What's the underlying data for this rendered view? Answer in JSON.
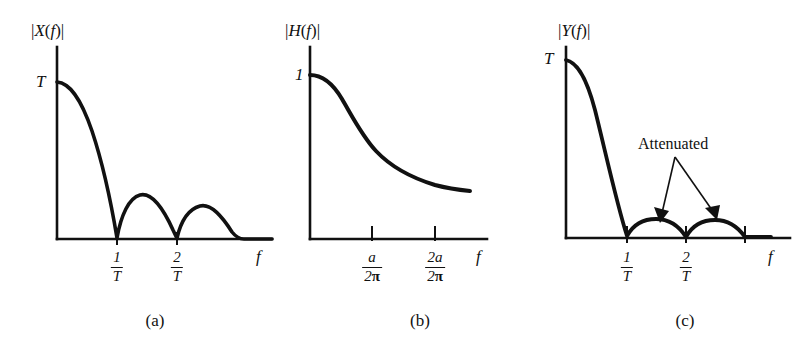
{
  "figure": {
    "background": "#ffffff",
    "ink": "#111111"
  },
  "panels": [
    {
      "id": "a",
      "caption": "(a)",
      "y_axis_label": "|X(f)|",
      "y_value_label": "T",
      "x_axis_label": "f",
      "tick_labels": [
        {
          "num": "1",
          "den": "T"
        },
        {
          "num": "2",
          "den": "T"
        }
      ],
      "annotations": []
    },
    {
      "id": "b",
      "caption": "(b)",
      "y_axis_label": "|H(f)|",
      "y_value_label": "1",
      "x_axis_label": "f",
      "tick_labels": [
        {
          "num": "a",
          "den": "2π"
        },
        {
          "num": "2a",
          "den": "2π"
        }
      ],
      "annotations": []
    },
    {
      "id": "c",
      "caption": "(c)",
      "y_axis_label": "|Y(f)|",
      "y_value_label": "T",
      "x_axis_label": "f",
      "tick_labels": [
        {
          "num": "1",
          "den": "T"
        },
        {
          "num": "2",
          "den": "T"
        }
      ],
      "annotations": [
        "Attenuated"
      ]
    }
  ],
  "chart_data": [
    {
      "type": "line",
      "title": "|X(f)|",
      "xlabel": "f",
      "ylabel": "|X(f)|",
      "curve": "rectified sinc magnitude spectrum |T sinc(fT)|",
      "x_tick_values": [
        1,
        2
      ],
      "x_tick_text": [
        "1/T",
        "2/T"
      ],
      "y_tick_values": [
        1
      ],
      "y_tick_text": [
        "T"
      ],
      "xlim": [
        0,
        3.6
      ],
      "ylim": [
        0,
        1.12
      ],
      "grid": false,
      "legend": "none",
      "x": [
        0.0,
        0.1,
        0.2,
        0.3,
        0.4,
        0.5,
        0.6,
        0.7,
        0.8,
        0.9,
        1.0,
        1.1,
        1.2,
        1.3,
        1.4,
        1.5,
        1.6,
        1.7,
        1.8,
        1.9,
        2.0,
        2.1,
        2.2,
        2.3,
        2.4,
        2.5,
        2.6,
        2.7,
        2.8,
        2.9,
        3.0,
        3.1,
        3.2,
        3.3,
        3.4,
        3.5
      ],
      "y": [
        1.0,
        0.984,
        0.935,
        0.858,
        0.757,
        0.637,
        0.505,
        0.368,
        0.234,
        0.109,
        0.0,
        0.089,
        0.156,
        0.198,
        0.216,
        0.212,
        0.189,
        0.151,
        0.104,
        0.052,
        0.0,
        0.047,
        0.086,
        0.114,
        0.129,
        0.127,
        0.113,
        0.091,
        0.063,
        0.032,
        0.0,
        0.031,
        0.057,
        0.076,
        0.087,
        0.089
      ]
    },
    {
      "type": "line",
      "title": "|H(f)|",
      "xlabel": "f",
      "ylabel": "|H(f)|",
      "curve": "first-order lowpass magnitude response 1/sqrt(1+(2πf/a)^2)",
      "x_tick_values": [
        1,
        2
      ],
      "x_tick_text": [
        "a/2π",
        "2a/2π"
      ],
      "y_tick_values": [
        1
      ],
      "y_tick_text": [
        "1"
      ],
      "xlim": [
        0,
        2.9
      ],
      "ylim": [
        0,
        1.12
      ],
      "grid": false,
      "legend": "none",
      "x": [
        0.0,
        0.2,
        0.4,
        0.6,
        0.8,
        1.0,
        1.2,
        1.4,
        1.6,
        1.8,
        2.0,
        2.2,
        2.4,
        2.6
      ],
      "y": [
        1.0,
        0.98,
        0.93,
        0.86,
        0.78,
        0.7,
        0.64,
        0.58,
        0.53,
        0.49,
        0.45,
        0.42,
        0.4,
        0.38
      ]
    },
    {
      "type": "line",
      "title": "|Y(f)|",
      "xlabel": "f",
      "ylabel": "|Y(f)|",
      "curve": "filtered output |X(f)H(f)| — main lobe nearly linear, sidelobes strongly attenuated",
      "x_tick_values": [
        1,
        2,
        3
      ],
      "x_tick_text": [
        "1/T",
        "2/T",
        ""
      ],
      "y_tick_values": [
        1
      ],
      "y_tick_text": [
        "T"
      ],
      "xlim": [
        0,
        3.6
      ],
      "ylim": [
        0,
        1.12
      ],
      "grid": false,
      "legend": "none",
      "annotation": "Attenuated",
      "x": [
        0.0,
        0.1,
        0.2,
        0.3,
        0.4,
        0.5,
        0.6,
        0.7,
        0.8,
        0.9,
        1.0,
        1.1,
        1.2,
        1.3,
        1.4,
        1.5,
        1.6,
        1.7,
        1.8,
        1.9,
        2.0,
        2.1,
        2.2,
        2.3,
        2.4,
        2.5,
        2.6,
        2.7,
        2.8,
        2.9,
        3.0
      ],
      "y": [
        1.0,
        0.9,
        0.8,
        0.7,
        0.6,
        0.5,
        0.4,
        0.3,
        0.2,
        0.1,
        0.0,
        0.022,
        0.04,
        0.052,
        0.057,
        0.056,
        0.05,
        0.04,
        0.027,
        0.014,
        0.0,
        0.013,
        0.024,
        0.032,
        0.037,
        0.036,
        0.032,
        0.026,
        0.018,
        0.009,
        0.0
      ]
    }
  ]
}
